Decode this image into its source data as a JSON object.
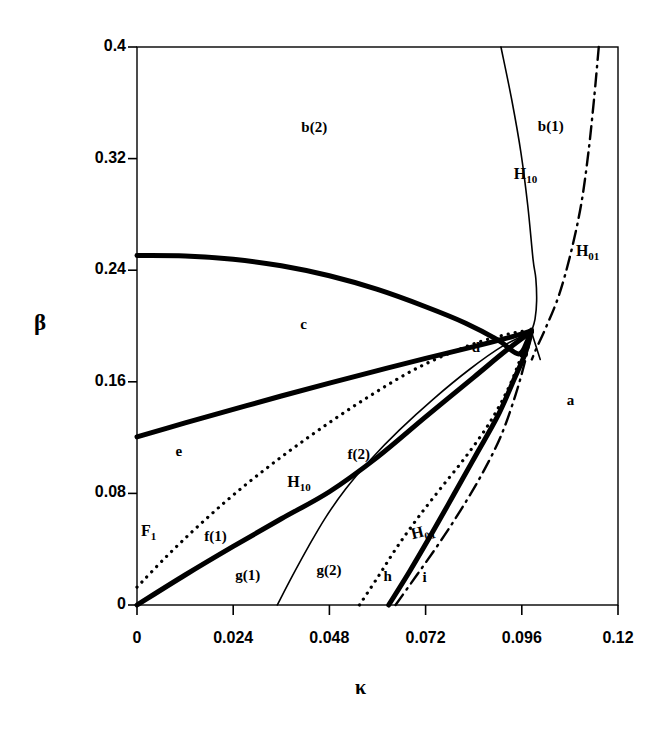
{
  "figure": {
    "width": 667,
    "height": 734,
    "background": "#ffffff",
    "ink": "#000000"
  },
  "chart_data": {
    "type": "line",
    "title": "",
    "subtitle": "",
    "xlabel": "κ",
    "ylabel": "β",
    "xlim": [
      0,
      0.12
    ],
    "ylim": [
      0,
      0.4
    ],
    "xticks": [
      "0",
      "0.024",
      "0.048",
      "0.072",
      "0.096",
      "0.12"
    ],
    "xtick_values": [
      0,
      0.024,
      0.048,
      0.072,
      0.096,
      0.12
    ],
    "yticks": [
      "0",
      "0.08",
      "0.16",
      "0.24",
      "0.32",
      "0.4"
    ],
    "ytick_values": [
      0,
      0.08,
      0.16,
      0.24,
      0.32,
      0.4
    ],
    "grid": false,
    "legend": "none",
    "series": [
      {
        "name": "c-upper-thick",
        "style": "thick-solid",
        "width": 5,
        "points": [
          [
            0.0,
            0.2505
          ],
          [
            0.012,
            0.2502
          ],
          [
            0.024,
            0.2478
          ],
          [
            0.036,
            0.2432
          ],
          [
            0.048,
            0.236
          ],
          [
            0.06,
            0.2262
          ],
          [
            0.072,
            0.2138
          ],
          [
            0.082,
            0.202
          ],
          [
            0.09,
            0.19
          ],
          [
            0.0952,
            0.18
          ],
          [
            0.0975,
            0.19
          ],
          [
            0.0984,
            0.197
          ]
        ]
      },
      {
        "name": "e-c-divider-thick",
        "style": "thick-solid",
        "width": 5,
        "points": [
          [
            0.0,
            0.1205
          ],
          [
            0.012,
            0.1305
          ],
          [
            0.024,
            0.1402
          ],
          [
            0.036,
            0.1498
          ],
          [
            0.048,
            0.159
          ],
          [
            0.06,
            0.168
          ],
          [
            0.072,
            0.1768
          ],
          [
            0.084,
            0.1852
          ],
          [
            0.0925,
            0.1915
          ],
          [
            0.0984,
            0.1965
          ]
        ]
      },
      {
        "name": "f1-g1-divider-thick",
        "style": "thick-solid",
        "width": 5,
        "points": [
          [
            0.0,
            0.0
          ],
          [
            0.012,
            0.0215
          ],
          [
            0.024,
            0.042
          ],
          [
            0.036,
            0.0618
          ],
          [
            0.048,
            0.0812
          ],
          [
            0.06,
            0.106
          ],
          [
            0.072,
            0.1348
          ],
          [
            0.084,
            0.1632
          ],
          [
            0.092,
            0.1822
          ],
          [
            0.0984,
            0.196
          ]
        ]
      },
      {
        "name": "h-i-divider-thick",
        "style": "thick-solid",
        "width": 5,
        "points": [
          [
            0.0628,
            0.0
          ],
          [
            0.068,
            0.024
          ],
          [
            0.0735,
            0.051
          ],
          [
            0.079,
            0.079
          ],
          [
            0.0845,
            0.1072
          ],
          [
            0.09,
            0.1355
          ],
          [
            0.0942,
            0.1625
          ],
          [
            0.0968,
            0.18
          ],
          [
            0.0984,
            0.1958
          ]
        ]
      },
      {
        "name": "H10-upper-thin",
        "style": "thin-solid",
        "width": 1.6,
        "points": [
          [
            0.0908,
            0.4
          ],
          [
            0.0935,
            0.362
          ],
          [
            0.0958,
            0.324
          ],
          [
            0.0975,
            0.286
          ],
          [
            0.0988,
            0.248
          ],
          [
            0.0995,
            0.234
          ],
          [
            0.0997,
            0.218
          ],
          [
            0.0993,
            0.205
          ],
          [
            0.0984,
            0.1958
          ]
        ]
      },
      {
        "name": "H10-upper-thin-continuation",
        "style": "thin-solid",
        "width": 1.6,
        "points": [
          [
            0.0984,
            0.1958
          ],
          [
            0.1006,
            0.176
          ]
        ]
      },
      {
        "name": "H10-lower-thin",
        "style": "thin-solid",
        "width": 1.6,
        "points": [
          [
            0.035,
            0.0
          ],
          [
            0.0388,
            0.021
          ],
          [
            0.0428,
            0.042
          ],
          [
            0.047,
            0.0625
          ],
          [
            0.052,
            0.083
          ],
          [
            0.0582,
            0.104
          ],
          [
            0.0655,
            0.1255
          ],
          [
            0.074,
            0.1478
          ],
          [
            0.083,
            0.169
          ],
          [
            0.091,
            0.1852
          ],
          [
            0.0984,
            0.1958
          ]
        ]
      },
      {
        "name": "F1-dotted",
        "style": "dotted",
        "width": 3.2,
        "points": [
          [
            0.0,
            0.0128
          ],
          [
            0.0075,
            0.0352
          ],
          [
            0.0155,
            0.0572
          ],
          [
            0.0245,
            0.08
          ],
          [
            0.0345,
            0.1028
          ],
          [
            0.0455,
            0.1258
          ],
          [
            0.0575,
            0.1488
          ],
          [
            0.07,
            0.17
          ],
          [
            0.083,
            0.1862
          ],
          [
            0.093,
            0.1945
          ],
          [
            0.0984,
            0.1968
          ]
        ]
      },
      {
        "name": "H01-dotted-lower",
        "style": "dotted",
        "width": 3.2,
        "points": [
          [
            0.0555,
            0.0
          ],
          [
            0.0602,
            0.0205
          ],
          [
            0.0648,
            0.0412
          ],
          [
            0.07,
            0.0622
          ],
          [
            0.0758,
            0.0838
          ],
          [
            0.082,
            0.1062
          ],
          [
            0.088,
            0.1308
          ],
          [
            0.0928,
            0.1562
          ],
          [
            0.096,
            0.179
          ],
          [
            0.0984,
            0.195
          ]
        ]
      },
      {
        "name": "H01-dashdot-lower",
        "style": "dash-dot",
        "width": 2.4,
        "points": [
          [
            0.0645,
            0.0
          ],
          [
            0.07,
            0.0222
          ],
          [
            0.0755,
            0.0448
          ],
          [
            0.0808,
            0.0682
          ],
          [
            0.086,
            0.0935
          ],
          [
            0.0908,
            0.1212
          ],
          [
            0.0945,
            0.1512
          ],
          [
            0.097,
            0.1768
          ],
          [
            0.0984,
            0.1952
          ]
        ]
      },
      {
        "name": "H01-dashdot-upper",
        "style": "dash-dot",
        "width": 2.4,
        "points": [
          [
            0.1152,
            0.4
          ],
          [
            0.114,
            0.362
          ],
          [
            0.1126,
            0.324
          ],
          [
            0.1108,
            0.287
          ],
          [
            0.1082,
            0.252
          ],
          [
            0.1052,
            0.2215
          ],
          [
            0.1018,
            0.1975
          ],
          [
            0.0998,
            0.185
          ],
          [
            0.0985,
            0.176
          ]
        ]
      }
    ],
    "region_labels": [
      {
        "name": "a",
        "text": "a",
        "x": 0.1072,
        "y": 0.146
      },
      {
        "name": "b1",
        "text": "b(1)",
        "x": 0.1,
        "y": 0.343
      },
      {
        "name": "b2",
        "text": "b(2)",
        "x": 0.041,
        "y": 0.342
      },
      {
        "name": "c",
        "text": "c",
        "x": 0.0407,
        "y": 0.201
      },
      {
        "name": "d",
        "text": "d",
        "x": 0.0835,
        "y": 0.184
      },
      {
        "name": "e",
        "text": "e",
        "x": 0.0096,
        "y": 0.11
      },
      {
        "name": "f1",
        "text": "f(1)",
        "x": 0.0168,
        "y": 0.049
      },
      {
        "name": "f2",
        "text": "f(2)",
        "x": 0.0525,
        "y": 0.1075
      },
      {
        "name": "g1",
        "text": "g(1)",
        "x": 0.0245,
        "y": 0.0208
      },
      {
        "name": "g2",
        "text": "g(2)",
        "x": 0.0448,
        "y": 0.0245
      },
      {
        "name": "h",
        "text": "h",
        "x": 0.0615,
        "y": 0.02
      },
      {
        "name": "i",
        "text": "i",
        "x": 0.0712,
        "y": 0.0195
      }
    ],
    "curve_labels": [
      {
        "name": "H10-upper",
        "base": "H",
        "sub": "10",
        "x": 0.094,
        "y": 0.308
      },
      {
        "name": "H01-upper",
        "base": "H",
        "sub": "01",
        "x": 0.1095,
        "y": 0.253
      },
      {
        "name": "H10-lower",
        "base": "H",
        "sub": "10",
        "x": 0.0375,
        "y": 0.0878
      },
      {
        "name": "H01-lower",
        "base": "H",
        "sub": "01",
        "x": 0.0692,
        "y": 0.0503,
        "slanted": true
      },
      {
        "name": "F1",
        "base": "F",
        "sub": "1",
        "x": 0.001,
        "y": 0.0522
      }
    ]
  }
}
